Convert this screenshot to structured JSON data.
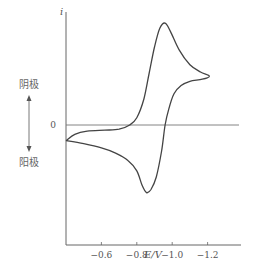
{
  "chart_data": {
    "type": "line",
    "title": "",
    "xlabel": "E/V",
    "ylabel": "i",
    "x_reversed": true,
    "xlim": [
      -0.4,
      -1.3
    ],
    "ylim": [
      -1.0,
      1.0
    ],
    "xticks": [
      -0.6,
      -0.8,
      -1.0,
      -1.2
    ],
    "xtick_labels": [
      "-0.6",
      "-0.8",
      "-1.0",
      "-1.2"
    ],
    "yticks": [
      0
    ],
    "ytick_labels": [
      "0"
    ],
    "zero_line": true,
    "grid": false,
    "annotations": {
      "cathode_label": "阴极",
      "anode_label": "阳极",
      "arrow": "double-vertical"
    },
    "series": [
      {
        "name": "cyclic voltammogram",
        "color": "#444444",
        "closed": true,
        "points": [
          [
            -0.4,
            -0.15
          ],
          [
            -0.45,
            -0.09
          ],
          [
            -0.52,
            -0.06
          ],
          [
            -0.62,
            -0.05
          ],
          [
            -0.7,
            -0.04
          ],
          [
            -0.76,
            0.0
          ],
          [
            -0.8,
            0.07
          ],
          [
            -0.84,
            0.25
          ],
          [
            -0.87,
            0.5
          ],
          [
            -0.9,
            0.75
          ],
          [
            -0.93,
            0.93
          ],
          [
            -0.96,
            0.98
          ],
          [
            -0.99,
            0.9
          ],
          [
            -1.04,
            0.72
          ],
          [
            -1.1,
            0.58
          ],
          [
            -1.16,
            0.51
          ],
          [
            -1.21,
            0.47
          ],
          [
            -1.17,
            0.44
          ],
          [
            -1.1,
            0.42
          ],
          [
            -1.05,
            0.38
          ],
          [
            -1.01,
            0.3
          ],
          [
            -0.98,
            0.15
          ],
          [
            -0.96,
            0.0
          ],
          [
            -0.94,
            -0.25
          ],
          [
            -0.91,
            -0.5
          ],
          [
            -0.88,
            -0.62
          ],
          [
            -0.855,
            -0.65
          ],
          [
            -0.83,
            -0.58
          ],
          [
            -0.8,
            -0.44
          ],
          [
            -0.75,
            -0.34
          ],
          [
            -0.68,
            -0.27
          ],
          [
            -0.6,
            -0.22
          ],
          [
            -0.5,
            -0.18
          ],
          [
            -0.4,
            -0.15
          ]
        ]
      }
    ]
  }
}
